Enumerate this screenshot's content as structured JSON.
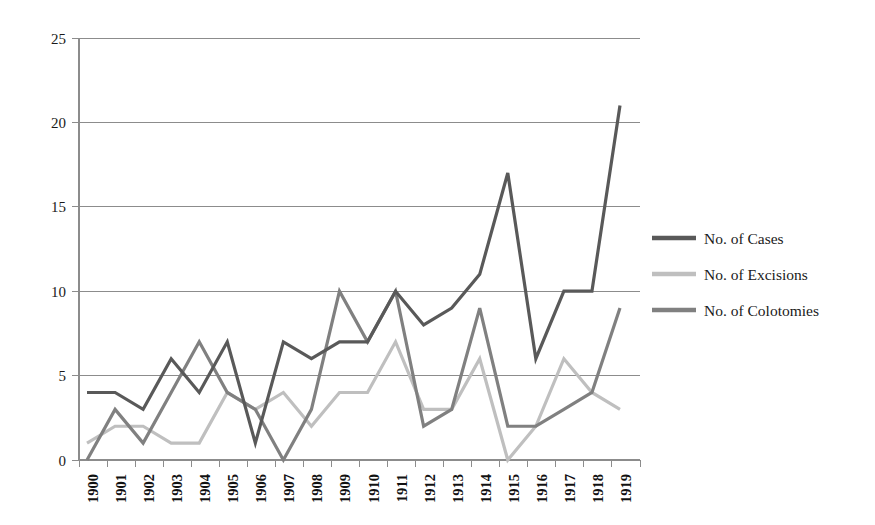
{
  "chart_data": {
    "type": "line",
    "title": "",
    "subtitle": "",
    "xlabel": "",
    "ylabel": "",
    "categories": [
      "1900",
      "1901",
      "1902",
      "1903",
      "1904",
      "1905",
      "1906",
      "1907",
      "1908",
      "1909",
      "1910",
      "1911",
      "1912",
      "1913",
      "1914",
      "1915",
      "1916",
      "1917",
      "1918",
      "1919"
    ],
    "x_tick_labels": [
      "1900",
      "1901",
      "1902",
      "1903",
      "1904",
      "1905",
      "1906",
      "1907",
      "1908",
      "1909",
      "1910",
      "1911",
      "1912",
      "1913",
      "1914",
      "1915",
      "1916",
      "1917",
      "1918",
      "1919"
    ],
    "y_tick_labels": [
      "0",
      "5",
      "10",
      "15",
      "20",
      "25"
    ],
    "y_ticks": [
      0,
      5,
      10,
      15,
      20,
      25
    ],
    "ylim": [
      0,
      25
    ],
    "grid": true,
    "grid_axis": "y",
    "legend_position": "right",
    "series": [
      {
        "name": "No. of Cases",
        "color": "#595959",
        "values": [
          4,
          4,
          3,
          6,
          4,
          7,
          1,
          7,
          6,
          7,
          7,
          10,
          8,
          9,
          11,
          17,
          6,
          10,
          10,
          21
        ]
      },
      {
        "name": "No. of Excisions",
        "color": "#bfbfbf",
        "values": [
          1,
          2,
          2,
          1,
          1,
          4,
          3,
          4,
          2,
          4,
          4,
          7,
          3,
          3,
          6,
          0,
          2,
          6,
          4,
          3
        ]
      },
      {
        "name": "No. of Colotomies",
        "color": "#808080",
        "values": [
          0,
          3,
          1,
          4,
          7,
          4,
          3,
          0,
          3,
          10,
          7,
          10,
          2,
          3,
          9,
          2,
          2,
          3,
          4,
          9
        ]
      }
    ]
  },
  "legend": {
    "items": [
      {
        "label": "No. of Cases",
        "color": "#595959"
      },
      {
        "label": "No. of Excisions",
        "color": "#bfbfbf"
      },
      {
        "label": "No. of Colotomies",
        "color": "#808080"
      }
    ]
  },
  "axes": {
    "y_labels": [
      "25",
      "20",
      "15",
      "10",
      "5",
      "0"
    ],
    "x_labels": [
      "1900",
      "1901",
      "1902",
      "1903",
      "1904",
      "1905",
      "1906",
      "1907",
      "1908",
      "1909",
      "1910",
      "1911",
      "1912",
      "1913",
      "1914",
      "1915",
      "1916",
      "1917",
      "1918",
      "1919"
    ]
  },
  "colors": {
    "cases": "#595959",
    "excisions": "#bfbfbf",
    "colotomies": "#808080",
    "axis": "#8c8c8c",
    "text": "#1a1a1a",
    "background": "#ffffff"
  }
}
